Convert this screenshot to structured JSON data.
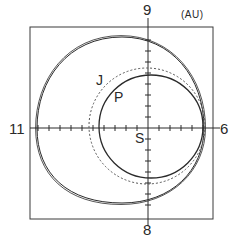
{
  "figure": {
    "unit_label": "(AU)",
    "axis_labels": {
      "top": "9",
      "bottom": "8",
      "left": "11",
      "right": "6"
    },
    "point_labels": {
      "sun": "S",
      "jupiter": "J",
      "planet": "P"
    },
    "colors": {
      "line": "#2a2a2a",
      "dashed": "#555555",
      "frame": "#3a3a3a",
      "background": "#ffffff"
    },
    "orbits": [
      {
        "name": "outer-orbit",
        "style": "double-solid"
      },
      {
        "name": "jupiter-orbit",
        "style": "dashed"
      },
      {
        "name": "p-orbit",
        "style": "solid"
      }
    ]
  }
}
